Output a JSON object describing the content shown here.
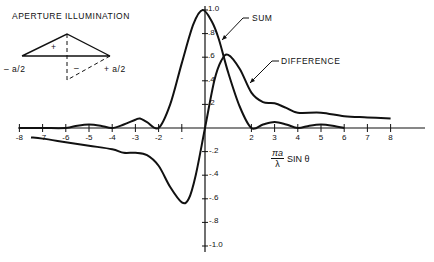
{
  "chart_data": {
    "type": "line",
    "title": "",
    "xlabel": "πa/λ SIN θ",
    "xlabel_parts": {
      "numerator": "πa",
      "denominator": "λ",
      "suffix": "SIN θ"
    },
    "ylabel": "",
    "xlim": [
      -8,
      8
    ],
    "ylim": [
      -1.0,
      1.0
    ],
    "grid": false,
    "x_ticks": [
      "-8",
      "-7",
      "-6",
      "-5",
      "-4",
      "-3",
      "-2",
      "-",
      "2",
      "3",
      "4",
      "5",
      "6",
      "7",
      "8"
    ],
    "x_tick_values": [
      -8,
      -7,
      -6,
      -5,
      -4,
      -3,
      -2,
      -1,
      2,
      3,
      4,
      5,
      6,
      7,
      8
    ],
    "y_ticks_pos": [
      "1.0",
      ".8",
      ".6",
      ".4",
      ".2"
    ],
    "y_ticks_neg": [
      "-.2",
      "-.4",
      "-.6",
      "-.8",
      "-1.0"
    ],
    "series": [
      {
        "name": "SUM",
        "x": [
          -8,
          -7,
          -6,
          -5.5,
          -5,
          -4.5,
          -4,
          -3.5,
          -3,
          -2.8,
          -2.5,
          -2,
          -1.5,
          -1,
          -0.5,
          -0.1,
          0.3,
          0.6,
          1,
          1.5,
          2,
          2.5,
          3,
          3.5,
          4,
          4.5,
          5,
          5.5,
          6
        ],
        "values": [
          0,
          0,
          0,
          0.02,
          0.03,
          0.02,
          0,
          0.03,
          0.07,
          0.08,
          0.05,
          0,
          0.2,
          0.55,
          0.88,
          1.0,
          0.9,
          0.75,
          0.47,
          0.18,
          0,
          0.03,
          0.05,
          0.03,
          0,
          0.02,
          0.03,
          0.02,
          0
        ]
      },
      {
        "name": "DIFFERENCE",
        "x": [
          -7.5,
          -7,
          -6,
          -5,
          -4,
          -3.5,
          -3,
          -2.5,
          -2,
          -1.5,
          -1,
          -0.7,
          -0.4,
          0,
          0.4,
          0.7,
          1,
          1.5,
          2,
          2.5,
          3,
          3.5,
          4,
          5,
          6,
          7,
          8
        ],
        "values": [
          -0.08,
          -0.09,
          -0.12,
          -0.15,
          -0.18,
          -0.21,
          -0.21,
          -0.23,
          -0.32,
          -0.5,
          -0.63,
          -0.6,
          -0.4,
          0,
          0.4,
          0.57,
          0.62,
          0.5,
          0.3,
          0.22,
          0.21,
          0.17,
          0.13,
          0.13,
          0.1,
          0.09,
          0.08
        ]
      }
    ],
    "annotations": [
      "SUM",
      "DIFFERENCE"
    ],
    "legend_position": "annotations with leader lines",
    "inset": {
      "title": "APERTURE ILLUMINATION",
      "left_label": "-a/2",
      "right_label": "+a/2",
      "plus_sign": "+",
      "minus_sign": "-"
    }
  },
  "labels": {
    "inset_title": "APERTURE ILLUMINATION",
    "inset_left": "– a/2",
    "inset_right": "+ a/2",
    "inset_plus": "+",
    "inset_minus": "–",
    "sum": "SUM",
    "difference": "DIFFERENCE",
    "x_num": "πa",
    "x_den": "λ",
    "x_suffix": "SIN θ"
  }
}
